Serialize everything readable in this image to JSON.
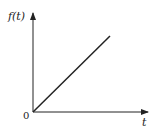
{
  "diagram": {
    "y_axis_label": "f(t)",
    "x_axis_label": "t",
    "origin_label": "0",
    "function": "linear ramp through origin",
    "colors": {
      "ink": "#222222",
      "background": "#ffffff"
    }
  }
}
